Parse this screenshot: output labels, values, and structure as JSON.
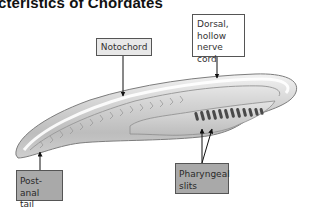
{
  "title": "cteristics of Chordates",
  "labels": {
    "notochord": "Notochord",
    "dorsal_nerve_cord": [
      "Dorsal,",
      "hollow",
      "nerve cord"
    ],
    "post_anal_tail": [
      "Post-anal",
      "tail"
    ],
    "pharyngeal_slits": [
      "Pharyngeal",
      "slits"
    ]
  },
  "colors": {
    "label_fill_light": "#e8e8e8",
    "label_fill_white": "#ffffff",
    "label_fill_dark": "#a9a9a9",
    "label_border": "#555555",
    "arrow": "#111111",
    "body_outline": "#8a8a8a",
    "body_fill": "#d9d9d9",
    "slits": "#4a4a4a"
  },
  "slit_count": 13
}
